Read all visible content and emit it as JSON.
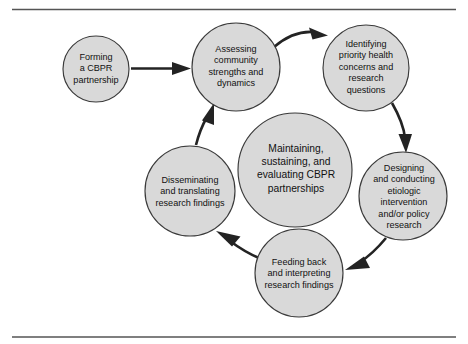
{
  "figure": {
    "type": "cyclical-process-diagram",
    "frame": {
      "top_rule": true,
      "bottom_rule": true,
      "rule_color": "#555555"
    },
    "colors": {
      "node_fill": "#d9d9d9",
      "node_stroke": "#3a3a3a",
      "arrow": "#232323",
      "text": "#111111",
      "background": "#ffffff"
    }
  },
  "nodes": [
    {
      "id": "forming",
      "label": "Forming\na CBPR\npartnership",
      "cx": 96,
      "cy": 69,
      "r": 33
    },
    {
      "id": "assessing",
      "label": "Assessing\ncommunity\nstrengths and\ndynamics",
      "cx": 236,
      "cy": 67,
      "r": 44
    },
    {
      "id": "identifying",
      "label": "Identifying\npriority health\nconcerns and\nresearch\nquestions",
      "cx": 366,
      "cy": 68,
      "r": 43
    },
    {
      "id": "designing",
      "label": "Designing\nand conducting\netiologic\nintervention\nand/or policy\nresearch",
      "cx": 403,
      "cy": 196,
      "r": 44
    },
    {
      "id": "feeding-back",
      "label": "Feeding back\nand interpreting\nresearch findings",
      "cx": 299,
      "cy": 273,
      "r": 44
    },
    {
      "id": "disseminating",
      "label": "Disseminating\nand translating\nresearch findings",
      "cx": 190,
      "cy": 191,
      "r": 45
    }
  ],
  "center_node": {
    "id": "maintaining",
    "label": "Maintaining,\nsustaining, and\nevaluating CBPR\npartnerships",
    "cx": 295,
    "cy": 170,
    "r": 57
  },
  "arrows": [
    {
      "id": "forming-to-assessing",
      "from": "forming",
      "to": "assessing"
    },
    {
      "id": "assessing-to-identifying",
      "from": "assessing",
      "to": "identifying"
    },
    {
      "id": "identifying-to-designing",
      "from": "identifying",
      "to": "designing"
    },
    {
      "id": "designing-to-feeding-back",
      "from": "designing",
      "to": "feeding-back"
    },
    {
      "id": "feeding-back-to-disseminating",
      "from": "feeding-back",
      "to": "disseminating"
    },
    {
      "id": "disseminating-to-assessing",
      "from": "disseminating",
      "to": "assessing"
    }
  ]
}
